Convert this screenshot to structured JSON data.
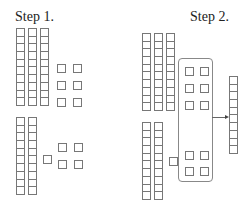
{
  "step1": {
    "label": "Step 1.",
    "tens_top": {
      "count": 3,
      "cells_per_column": 10
    },
    "ones_top": {
      "count": 6
    },
    "tens_bottom": {
      "count": 2,
      "cells_per_column": 10
    },
    "ones_bottom": {
      "count": 5
    }
  },
  "step2": {
    "label": "Step 2.",
    "tens_top": {
      "count": 3,
      "cells_per_column": 10
    },
    "tens_bottom": {
      "count": 2,
      "cells_per_column": 10
    },
    "grouped_ones": {
      "count": 10
    },
    "leftover_ones": {
      "count": 1
    },
    "result_ten": {
      "cells_per_column": 10
    },
    "arrow": "regroup-arrow"
  },
  "colors": {
    "stroke": "#777777",
    "text": "#222222",
    "background": "#ffffff"
  }
}
